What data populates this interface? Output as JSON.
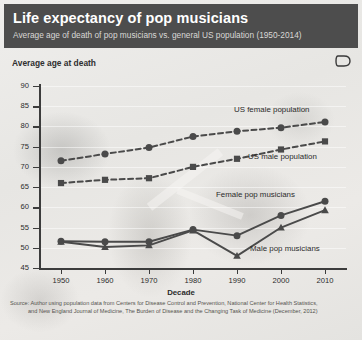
{
  "header": {
    "title": "Life expectancy of pop musicians",
    "subtitle": "Average age of death of pop musicians vs. general US population (1950-2014)",
    "logo_icon": "d-monogram-icon"
  },
  "axis_title": "Average age at death",
  "source": {
    "line1": "Source: Author using population data from Centers for Disease Control and Prevention, National Center for Health Statistics,",
    "line2": "and New England Journal of Medicine, The Burden of Disease and the Changing Task of Medicine (December, 2012)"
  },
  "colors": {
    "header_bg": "#4d4d4d",
    "header_text": "#ffffff",
    "header_subtitle_text": "#d9d8d6",
    "series": "#4a4a4a",
    "axis": "#3c3c3c",
    "grid": "#ffffff",
    "plot_bg": "#e9e8e5"
  },
  "chart_data": {
    "type": "line",
    "title": "Life expectancy of pop musicians",
    "subtitle": "Average age of death of pop musicians vs. general US population (1950-2014)",
    "xlabel": "Decade",
    "ylabel": "Average age at death",
    "x": [
      1950,
      1960,
      1970,
      1980,
      1990,
      2000,
      2010
    ],
    "xticklabels": [
      "1950",
      "1960",
      "1970",
      "1980",
      "1990",
      "2000",
      "2010"
    ],
    "yticklabels": [
      "90",
      "85",
      "80",
      "75",
      "70",
      "65",
      "60",
      "55",
      "50",
      "45"
    ],
    "ylim": [
      45,
      90
    ],
    "ytick_step": 5,
    "xlim": [
      1945,
      2015
    ],
    "grid": true,
    "legend_position": "inline-labels",
    "series": [
      {
        "name": "US female population",
        "label": "US female population",
        "style": "dashed",
        "marker": "circle",
        "values": [
          71.5,
          73.2,
          74.8,
          77.5,
          78.8,
          79.7,
          81.1
        ]
      },
      {
        "name": "US male population",
        "label": "US male population",
        "style": "dashed",
        "marker": "square",
        "values": [
          66.0,
          66.8,
          67.2,
          70.0,
          72.0,
          74.3,
          76.3
        ]
      },
      {
        "name": "Female pop musicians",
        "label": "Female pop musicians",
        "style": "solid",
        "marker": "circle",
        "values": [
          51.6,
          51.5,
          51.5,
          54.5,
          53.0,
          58.0,
          61.5
        ]
      },
      {
        "name": "Male pop musicians",
        "label": "Male pop musicians",
        "style": "solid",
        "marker": "triangle",
        "values": [
          51.5,
          50.2,
          50.6,
          54.3,
          48.0,
          55.0,
          59.3
        ]
      }
    ]
  }
}
